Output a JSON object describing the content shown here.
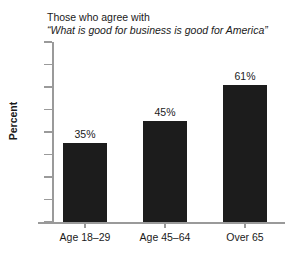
{
  "chart_data": {
    "type": "bar",
    "title_lines": [
      {
        "text": "Those who agree with",
        "style": "roman"
      },
      {
        "text": "“What is good for business is good for America”",
        "style": "italic"
      }
    ],
    "categories": [
      "Age 18–29",
      "Age 45–64",
      "Over 65"
    ],
    "values": [
      35,
      45,
      61
    ],
    "data_labels": [
      "35%",
      "45%",
      "61%"
    ],
    "xlabel": "",
    "ylabel": "Percent",
    "ylim": [
      0,
      80
    ],
    "yticks": [
      0,
      10,
      20,
      30,
      40,
      50,
      60,
      70,
      80
    ],
    "ytick_labels": [
      "0",
      "10",
      "20",
      "30",
      "40",
      "50",
      "60",
      "70",
      "80"
    ],
    "grid": false,
    "legend": false,
    "bar_color": "#1c1c1c",
    "axis_color": "#9a9a9a",
    "background": "#ffffff"
  }
}
